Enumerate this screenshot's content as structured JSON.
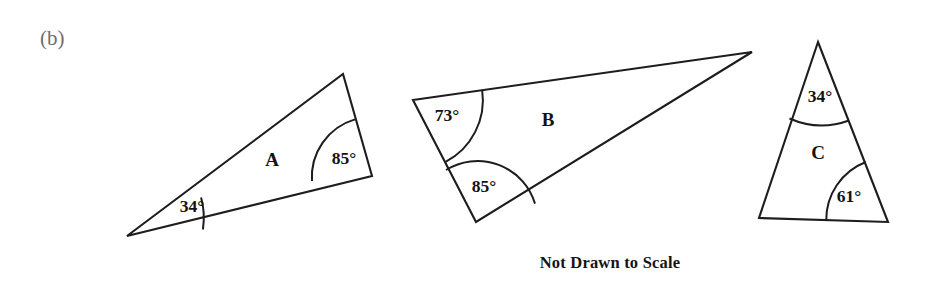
{
  "page": {
    "background_color": "#ffffff",
    "stroke_color": "#1d1d1f",
    "text_color": "#131313",
    "item_label_color": "#6e6e70",
    "width": 932,
    "height": 288
  },
  "item_label": {
    "text": "(b)",
    "x": 40,
    "y": 40
  },
  "caption": {
    "text": "Not Drawn to Scale",
    "x": 610,
    "y": 264
  },
  "figures": [
    {
      "id": "triangle-a",
      "label": "A",
      "label_x": 272,
      "label_y": 162,
      "points": "127,236 343,74 372,176",
      "vertices": {
        "left": [
          127,
          236
        ],
        "top": [
          343,
          74
        ],
        "right": [
          372,
          176
        ]
      },
      "angles": [
        {
          "name": "angle-34",
          "value": "34°",
          "label_x": 192,
          "label_y": 208,
          "arc_path": "M 201.1 197.6 A 76 76 0 0 1 202.9 229.5",
          "vertex": [
            127,
            236
          ]
        },
        {
          "name": "angle-85",
          "value": "85°",
          "label_x": 344,
          "label_y": 160,
          "arc_path": "M 312.0 181.0 A 60 60 0 0 1 355.0 119.4",
          "vertex": [
            372,
            176
          ]
        }
      ]
    },
    {
      "id": "triangle-b",
      "label": "B",
      "label_x": 548,
      "label_y": 122,
      "points": "413,100 752,52 476,222",
      "vertices": {
        "top_left": [
          413,
          100
        ],
        "tip": [
          752,
          52
        ],
        "bottom": [
          476,
          222
        ]
      },
      "angles": [
        {
          "name": "angle-73",
          "value": "73°",
          "label_x": 447,
          "label_y": 117,
          "arc_path": "M 482.2 90.3 A 70 70 0 0 1 445.6 161.9",
          "vertex": [
            413,
            100
          ]
        },
        {
          "name": "angle-85",
          "value": "85°",
          "label_x": 484,
          "label_y": 188,
          "arc_path": "M 446.0 170.0 A 60 60 0 0 1 535.0 203.6",
          "vertex": [
            476,
            222
          ]
        }
      ]
    },
    {
      "id": "triangle-c",
      "label": "C",
      "label_x": 818,
      "label_y": 155,
      "points": "818,42 888,222 759,218",
      "vertices": {
        "apex": [
          818,
          42
        ],
        "bottom_right": [
          888,
          222
        ],
        "bottom_left": [
          759,
          218
        ]
      },
      "angles": [
        {
          "name": "angle-34",
          "value": "34°",
          "label_x": 820,
          "label_y": 98,
          "arc_path": "M 789.5 118.5 A 80 80 0 0 0 849.0 120.5",
          "vertex": [
            818,
            42
          ]
        },
        {
          "name": "angle-61",
          "value": "61°",
          "label_x": 849,
          "label_y": 198,
          "arc_path": "M 865.8 162.0 A 62 62 0 0 0 826.2 220.9",
          "vertex": [
            888,
            222
          ]
        }
      ]
    }
  ]
}
